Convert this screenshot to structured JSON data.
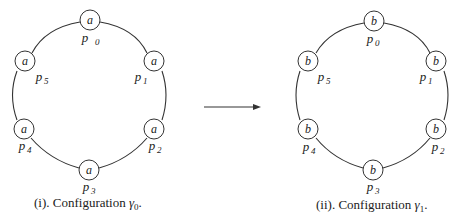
{
  "figures": [
    {
      "id": "gamma0",
      "caption_index": "(i)",
      "caption_text": ". Configuration ",
      "caption_symbol": "γ",
      "caption_sub": "0",
      "caption_end": ".",
      "nodes": [
        {
          "name": "p",
          "sub": "0",
          "value": "a"
        },
        {
          "name": "p",
          "sub": "1",
          "value": "a"
        },
        {
          "name": "p",
          "sub": "2",
          "value": "a"
        },
        {
          "name": "p",
          "sub": "3",
          "value": "a"
        },
        {
          "name": "p",
          "sub": "4",
          "value": "a"
        },
        {
          "name": "p",
          "sub": "5",
          "value": "a"
        }
      ]
    },
    {
      "id": "gamma1",
      "caption_index": "(ii)",
      "caption_text": ". Configuration ",
      "caption_symbol": "γ",
      "caption_sub": "1",
      "caption_end": ".",
      "nodes": [
        {
          "name": "p",
          "sub": "0",
          "value": "b"
        },
        {
          "name": "p",
          "sub": "1",
          "value": "b"
        },
        {
          "name": "p",
          "sub": "2",
          "value": "b"
        },
        {
          "name": "p",
          "sub": "3",
          "value": "b"
        },
        {
          "name": "p",
          "sub": "4",
          "value": "b"
        },
        {
          "name": "p",
          "sub": "5",
          "value": "b"
        }
      ]
    }
  ],
  "colors": {
    "stroke": "#333333",
    "text": "#222222",
    "background": "#ffffff"
  }
}
